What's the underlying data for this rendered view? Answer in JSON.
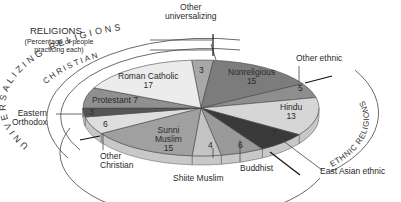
{
  "title": "RELIGIONS",
  "subtitle": "(Percentage of people practicing each)",
  "arc_labels": {
    "universalizing": "UNIVERSALIZING RELIGIONS",
    "christian": "CHRISTIAN",
    "ethnic": "ETHNIC RELIGIONS"
  },
  "chart_data": {
    "type": "pie",
    "title": "RELIGIONS",
    "subtitle": "(Percentage of people practicing each)",
    "groups": [
      {
        "name": "Universalizing religions",
        "members": [
          "Roman Catholic",
          "Protestant",
          "Eastern Orthodox",
          "Other Christian",
          "Sunni Muslim",
          "Shiite Muslim",
          "Buddhist",
          "Other universalizing"
        ]
      },
      {
        "name": "Christian",
        "members": [
          "Roman Catholic",
          "Protestant",
          "Eastern Orthodox",
          "Other Christian"
        ]
      },
      {
        "name": "Ethnic religions",
        "members": [
          "Hindu",
          "East Asian ethnic",
          "Other ethnic"
        ]
      }
    ],
    "slices": [
      {
        "label": "Other universalizing",
        "value": 3,
        "color": "#a8a8a8"
      },
      {
        "label": "Nonreligious",
        "value": 15,
        "color": "#7c7c7c"
      },
      {
        "label": "Other ethnic",
        "value": 5,
        "color": "#8e8e8e"
      },
      {
        "label": "Hindu",
        "value": 13,
        "color": "#d6d6d6"
      },
      {
        "label": "East Asian ethnic",
        "value": 7,
        "color": "#3a3a3a"
      },
      {
        "label": "Buddhist",
        "value": 6,
        "color": "#9a9a9a"
      },
      {
        "label": "Shiite Muslim",
        "value": 4,
        "color": "#c4c4c4"
      },
      {
        "label": "Sunni Muslim",
        "value": 15,
        "color": "#a0a0a0"
      },
      {
        "label": "Other Christian",
        "value": 6,
        "color": "#dedede"
      },
      {
        "label": "Eastern Orthodox",
        "value": 3,
        "color": "#555555"
      },
      {
        "label": "Protestant",
        "value": 7,
        "color": "#909090"
      },
      {
        "label": "Roman Catholic",
        "value": 17,
        "color": "#ececec"
      }
    ]
  },
  "labels": {
    "roman_catholic": {
      "name": "Roman Catholic",
      "value": "17"
    },
    "other_universalizing": {
      "name": "Other universalizing",
      "line1": "Other",
      "line2": "universalizing",
      "value": "3"
    },
    "nonreligious": {
      "name": "Nonreligious",
      "value": "15"
    },
    "other_ethnic": {
      "name": "Other ethnic",
      "value": "5"
    },
    "hindu": {
      "name": "Hindu",
      "value": "13"
    },
    "east_asian": {
      "name": "East Asian ethnic",
      "value": "7"
    },
    "buddhist": {
      "name": "Buddhist",
      "value": "6"
    },
    "shiite": {
      "name": "Shiite Muslim",
      "value": "4"
    },
    "sunni": {
      "line1": "Sunni",
      "line2": "Muslim",
      "value": "15"
    },
    "other_christian": {
      "line1": "Other",
      "line2": "Christian",
      "value": "6"
    },
    "eastern_orthodox": {
      "line1": "Eastern",
      "line2": "Orthodox",
      "value": "3"
    },
    "protestant": {
      "name": "Protestant",
      "value": "7"
    }
  }
}
